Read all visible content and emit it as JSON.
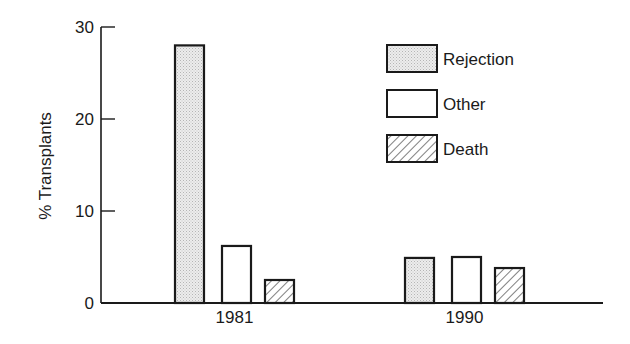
{
  "chart_data": {
    "type": "bar",
    "title": "",
    "xlabel": "",
    "ylabel": "% Transplants",
    "ylim": [
      0,
      30
    ],
    "yticks": [
      0,
      10,
      20,
      30
    ],
    "grid": false,
    "legend_position": "upper right (inside plot)",
    "categories": [
      "1981",
      "1990"
    ],
    "series": [
      {
        "name": "Rejection",
        "pattern": "stipple",
        "values": [
          28,
          4.9
        ]
      },
      {
        "name": "Other",
        "pattern": "solid-white",
        "values": [
          6.2,
          5.0
        ]
      },
      {
        "name": "Death",
        "pattern": "hatch",
        "values": [
          2.5,
          3.8
        ]
      }
    ]
  },
  "colors": {
    "stroke": "#1a1a1a",
    "stipple_fill": "#e6e6e6",
    "background": "#ffffff"
  }
}
